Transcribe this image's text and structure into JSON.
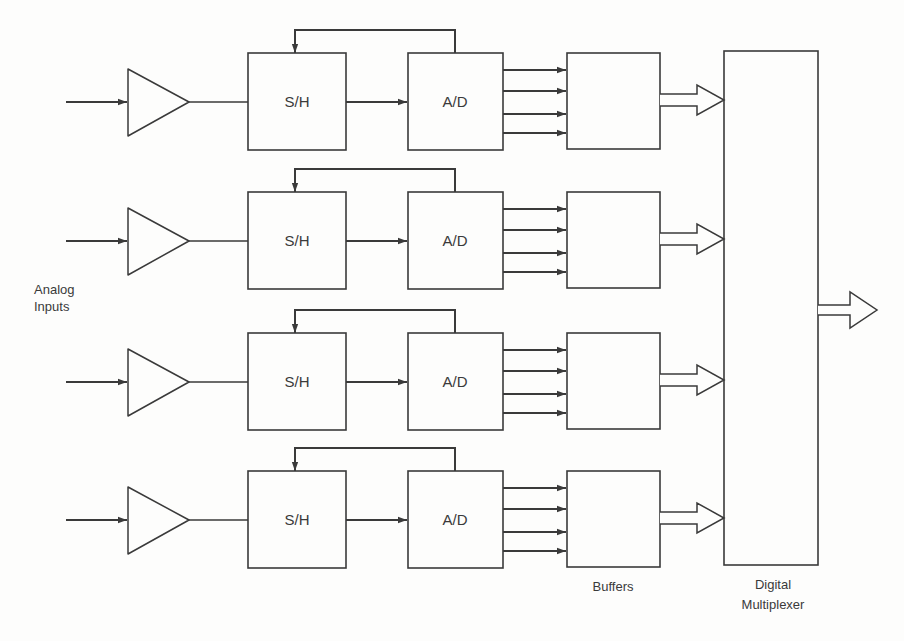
{
  "diagram": {
    "title_side_label": [
      "Analog",
      "Inputs"
    ],
    "channels": [
      {
        "index": 1,
        "sample_hold_label": "S/H",
        "converter_label": "A/D",
        "bit_lines": 4
      },
      {
        "index": 2,
        "sample_hold_label": "S/H",
        "converter_label": "A/D",
        "bit_lines": 4
      },
      {
        "index": 3,
        "sample_hold_label": "S/H",
        "converter_label": "A/D",
        "bit_lines": 4
      },
      {
        "index": 4,
        "sample_hold_label": "S/H",
        "converter_label": "A/D",
        "bit_lines": 4
      }
    ],
    "buffers_label": "Buffers",
    "multiplexer_label": [
      "Digital",
      "Multiplexer"
    ],
    "colors": {
      "line": "#3a3a3a",
      "background": "#fdfdfc"
    }
  }
}
